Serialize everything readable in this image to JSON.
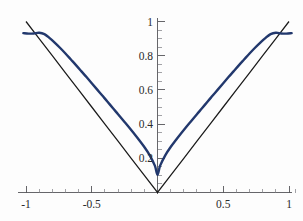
{
  "chart_data": {
    "type": "line",
    "title": "",
    "subtitle": "",
    "xlabel": "",
    "ylabel": "",
    "xlim": [
      -1.07,
      1.07
    ],
    "ylim": [
      0,
      1.04
    ],
    "grid": false,
    "legend": "none",
    "background_color": "#fdfdfd",
    "axis_color": "#55555a",
    "x_ticks_major": [
      -1,
      -0.5,
      0,
      0.5,
      1
    ],
    "x_tick_labels": [
      "-1",
      "-0.5",
      "",
      "0.5",
      "1"
    ],
    "x_ticks_minor": [
      -0.9,
      -0.8,
      -0.7,
      -0.6,
      -0.4,
      -0.3,
      -0.2,
      -0.1,
      0.1,
      0.2,
      0.3,
      0.4,
      0.6,
      0.7,
      0.8,
      0.9,
      1.05
    ],
    "y_ticks_major": [
      0.2,
      0.4,
      0.6,
      0.8,
      1
    ],
    "y_tick_labels": [
      "0.2",
      "0.4",
      "0.6",
      "0.8",
      "1"
    ],
    "y_ticks_minor": [
      0.05,
      0.1,
      0.15,
      0.25,
      0.3,
      0.35,
      0.45,
      0.5,
      0.55,
      0.65,
      0.7,
      0.75,
      0.85,
      0.9,
      0.95
    ],
    "series": [
      {
        "name": "abs",
        "color": "#1a1a1a",
        "width": 1.25,
        "x": [
          -1,
          -0.9,
          -0.8,
          -0.7,
          -0.6,
          -0.5,
          -0.4,
          -0.3,
          -0.2,
          -0.1,
          0,
          0.1,
          0.2,
          0.3,
          0.4,
          0.5,
          0.6,
          0.7,
          0.8,
          0.9,
          1
        ],
        "values": [
          1,
          0.9,
          0.8,
          0.7,
          0.6,
          0.5,
          0.4,
          0.3,
          0.2,
          0.1,
          0,
          0.1,
          0.2,
          0.3,
          0.4,
          0.5,
          0.6,
          0.7,
          0.8,
          0.9,
          1
        ]
      },
      {
        "name": "approximation",
        "color": "#22386d",
        "width": 2.4,
        "x": [
          -1.02,
          -0.98,
          -0.94,
          -0.9,
          -0.86,
          -0.82,
          -0.78,
          -0.74,
          -0.7,
          -0.66,
          -0.62,
          -0.58,
          -0.54,
          -0.5,
          -0.46,
          -0.42,
          -0.38,
          -0.34,
          -0.3,
          -0.26,
          -0.22,
          -0.18,
          -0.14,
          -0.1,
          -0.06,
          -0.02,
          0,
          0.02,
          0.06,
          0.1,
          0.14,
          0.18,
          0.22,
          0.26,
          0.3,
          0.34,
          0.38,
          0.42,
          0.46,
          0.5,
          0.54,
          0.58,
          0.62,
          0.66,
          0.7,
          0.74,
          0.78,
          0.82,
          0.86,
          0.9,
          0.94,
          0.98,
          1.02
        ],
        "values": [
          0.932,
          0.929,
          0.93,
          0.934,
          0.926,
          0.903,
          0.875,
          0.845,
          0.813,
          0.779,
          0.745,
          0.71,
          0.675,
          0.639,
          0.603,
          0.567,
          0.531,
          0.494,
          0.458,
          0.421,
          0.384,
          0.346,
          0.307,
          0.266,
          0.219,
          0.157,
          0.104,
          0.157,
          0.219,
          0.266,
          0.307,
          0.346,
          0.384,
          0.421,
          0.458,
          0.494,
          0.531,
          0.567,
          0.603,
          0.639,
          0.675,
          0.71,
          0.745,
          0.779,
          0.813,
          0.845,
          0.875,
          0.903,
          0.926,
          0.934,
          0.93,
          0.929,
          0.932
        ]
      }
    ],
    "annotations": [],
    "notes": {
      "approx_minimum_value": 0.104,
      "approx_endpoint_value": 0.932,
      "abs_minimum_value": 0
    }
  }
}
